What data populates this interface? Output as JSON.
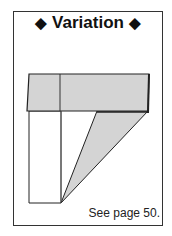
{
  "title": {
    "left_marker": "◆",
    "text": "Variation",
    "right_marker": "◆"
  },
  "diagram": {
    "fill_color": "#d4d4d4",
    "stroke_color": "#222222"
  },
  "caption": "See page 50."
}
